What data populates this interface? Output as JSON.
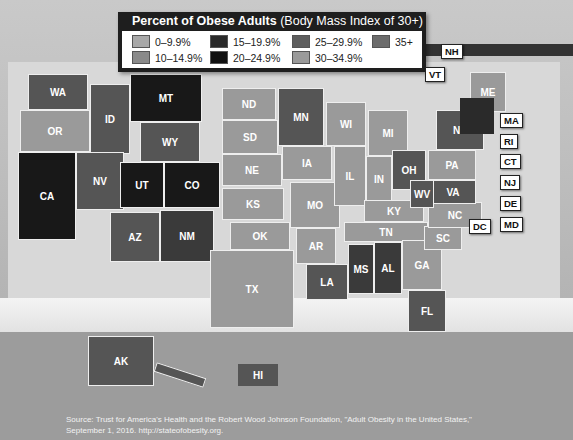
{
  "chart_data": {
    "type": "choropleth-map",
    "title": "Percent of Obese Adults",
    "subtitle": "(Body Mass Index of 30+)",
    "legend": [
      {
        "label": "0–9.9%",
        "color": "#a8a8a8"
      },
      {
        "label": "10–14.9%",
        "color": "#8a8a8a"
      },
      {
        "label": "15–19.9%",
        "color": "#2a2a2a"
      },
      {
        "label": "20–24.9%",
        "color": "#111111"
      },
      {
        "label": "25–29.9%",
        "color": "#5e5e5e"
      },
      {
        "label": "30–34.9%",
        "color": "#9a9a9a"
      },
      {
        "label": "35+",
        "color": "#6c6c6c"
      }
    ],
    "states": [
      {
        "id": "WA",
        "x": 28,
        "y": 74,
        "w": 60,
        "h": 36,
        "color": "#555"
      },
      {
        "id": "OR",
        "x": 20,
        "y": 110,
        "w": 70,
        "h": 42,
        "color": "#9a9a9a"
      },
      {
        "id": "CA",
        "x": 18,
        "y": 152,
        "w": 58,
        "h": 88,
        "color": "#181818"
      },
      {
        "id": "ID",
        "x": 90,
        "y": 84,
        "w": 40,
        "h": 70,
        "color": "#555"
      },
      {
        "id": "NV",
        "x": 76,
        "y": 152,
        "w": 48,
        "h": 58,
        "color": "#555"
      },
      {
        "id": "MT",
        "x": 130,
        "y": 74,
        "w": 72,
        "h": 48,
        "color": "#181818"
      },
      {
        "id": "WY",
        "x": 140,
        "y": 122,
        "w": 60,
        "h": 40,
        "color": "#555"
      },
      {
        "id": "UT",
        "x": 120,
        "y": 162,
        "w": 44,
        "h": 46,
        "color": "#181818"
      },
      {
        "id": "CO",
        "x": 164,
        "y": 162,
        "w": 56,
        "h": 46,
        "color": "#181818"
      },
      {
        "id": "AZ",
        "x": 110,
        "y": 212,
        "w": 50,
        "h": 50,
        "color": "#555"
      },
      {
        "id": "NM",
        "x": 160,
        "y": 210,
        "w": 54,
        "h": 52,
        "color": "#3a3a3a"
      },
      {
        "id": "ND",
        "x": 222,
        "y": 88,
        "w": 54,
        "h": 32,
        "color": "#9a9a9a"
      },
      {
        "id": "SD",
        "x": 222,
        "y": 120,
        "w": 56,
        "h": 34,
        "color": "#9a9a9a"
      },
      {
        "id": "NE",
        "x": 222,
        "y": 154,
        "w": 60,
        "h": 32,
        "color": "#9a9a9a"
      },
      {
        "id": "KS",
        "x": 222,
        "y": 188,
        "w": 62,
        "h": 32,
        "color": "#9a9a9a"
      },
      {
        "id": "OK",
        "x": 230,
        "y": 222,
        "w": 60,
        "h": 28,
        "color": "#9a9a9a"
      },
      {
        "id": "TX",
        "x": 210,
        "y": 250,
        "w": 84,
        "h": 78,
        "color": "#9a9a9a"
      },
      {
        "id": "MN",
        "x": 278,
        "y": 88,
        "w": 46,
        "h": 58,
        "color": "#555"
      },
      {
        "id": "IA",
        "x": 282,
        "y": 146,
        "w": 50,
        "h": 34,
        "color": "#9a9a9a"
      },
      {
        "id": "MO",
        "x": 290,
        "y": 182,
        "w": 50,
        "h": 46,
        "color": "#9a9a9a"
      },
      {
        "id": "AR",
        "x": 296,
        "y": 228,
        "w": 40,
        "h": 36,
        "color": "#9a9a9a"
      },
      {
        "id": "LA",
        "x": 306,
        "y": 264,
        "w": 42,
        "h": 36,
        "color": "#555"
      },
      {
        "id": "WI",
        "x": 326,
        "y": 102,
        "w": 40,
        "h": 44,
        "color": "#9a9a9a"
      },
      {
        "id": "IL",
        "x": 334,
        "y": 146,
        "w": 32,
        "h": 60,
        "color": "#9a9a9a"
      },
      {
        "id": "MI",
        "x": 368,
        "y": 110,
        "w": 40,
        "h": 46,
        "color": "#9a9a9a"
      },
      {
        "id": "IN",
        "x": 366,
        "y": 156,
        "w": 26,
        "h": 46,
        "color": "#9a9a9a"
      },
      {
        "id": "OH",
        "x": 392,
        "y": 150,
        "w": 34,
        "h": 40,
        "color": "#555"
      },
      {
        "id": "KY",
        "x": 364,
        "y": 200,
        "w": 60,
        "h": 22,
        "color": "#9a9a9a"
      },
      {
        "id": "TN",
        "x": 344,
        "y": 222,
        "w": 84,
        "h": 20,
        "color": "#9a9a9a"
      },
      {
        "id": "MS",
        "x": 348,
        "y": 244,
        "w": 26,
        "h": 50,
        "color": "#3a3a3a"
      },
      {
        "id": "AL",
        "x": 374,
        "y": 242,
        "w": 28,
        "h": 52,
        "color": "#3a3a3a"
      },
      {
        "id": "GA",
        "x": 402,
        "y": 240,
        "w": 40,
        "h": 50,
        "color": "#9a9a9a"
      },
      {
        "id": "FL",
        "x": 408,
        "y": 290,
        "w": 38,
        "h": 42,
        "color": "#555"
      },
      {
        "id": "SC",
        "x": 424,
        "y": 226,
        "w": 38,
        "h": 24,
        "color": "#9a9a9a"
      },
      {
        "id": "NC",
        "x": 428,
        "y": 202,
        "w": 54,
        "h": 26,
        "color": "#9a9a9a"
      },
      {
        "id": "VA",
        "x": 430,
        "y": 180,
        "w": 46,
        "h": 24,
        "color": "#555"
      },
      {
        "id": "WV",
        "x": 410,
        "y": 180,
        "w": 24,
        "h": 28,
        "color": "#555"
      },
      {
        "id": "PA",
        "x": 428,
        "y": 150,
        "w": 48,
        "h": 30,
        "color": "#9a9a9a"
      },
      {
        "id": "NY",
        "x": 436,
        "y": 110,
        "w": 48,
        "h": 40,
        "color": "#555"
      },
      {
        "id": "ME",
        "x": 470,
        "y": 72,
        "w": 36,
        "h": 40,
        "color": "#9a9a9a"
      }
    ],
    "callout_labels": [
      "NH",
      "VT",
      "MA",
      "RI",
      "CT",
      "NJ",
      "DE",
      "MD",
      "DC"
    ],
    "insets": [
      {
        "id": "AK",
        "color": "#555"
      },
      {
        "id": "HI",
        "color": "#555"
      }
    ]
  },
  "legend": {
    "title_bold": "Percent of Obese Adults",
    "title_rest": " (Body Mass Index of 30+)",
    "items": [
      {
        "label": "0–9.9%",
        "color": "#a8a8a8"
      },
      {
        "label": "15–19.9%",
        "color": "#2a2a2a"
      },
      {
        "label": "25–29.9%",
        "color": "#5e5e5e"
      },
      {
        "label": "35+",
        "color": "#6c6c6c"
      },
      {
        "label": "10–14.9%",
        "color": "#8a8a8a"
      },
      {
        "label": "20–24.9%",
        "color": "#111111"
      },
      {
        "label": "30–34.9%",
        "color": "#9a9a9a"
      }
    ]
  },
  "callouts": {
    "NH": "NH",
    "VT": "VT",
    "MA": "MA",
    "RI": "RI",
    "CT": "CT",
    "NJ": "NJ",
    "DE": "DE",
    "MD": "MD",
    "DC": "DC"
  },
  "insets": {
    "AK": "AK",
    "HI": "HI"
  },
  "source": {
    "line1": "Source: Trust for America's Health and the Robert Wood Johnson Foundation, \"Adult Obesity in the United States,\"",
    "line2": "September 1, 2016. http://stateofobesity.org."
  }
}
